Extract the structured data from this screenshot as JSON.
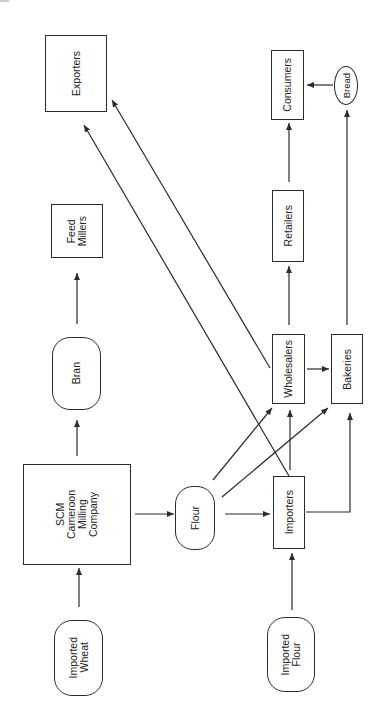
{
  "diagram": {
    "title": "",
    "orientation": "rotated-90-ccw",
    "nodes": [
      {
        "id": "imported_wheat",
        "label": "Imported\nWheat",
        "shape": "rounded"
      },
      {
        "id": "scm",
        "label": "SCM\nCameroon\nMilling\nCompany",
        "shape": "rect"
      },
      {
        "id": "bran",
        "label": "Bran",
        "shape": "rounded"
      },
      {
        "id": "feed_millers",
        "label": "Feed\nMillers",
        "shape": "rect"
      },
      {
        "id": "flour",
        "label": "Flour",
        "shape": "rounded"
      },
      {
        "id": "imported_flour",
        "label": "Imported\nFlour",
        "shape": "rounded"
      },
      {
        "id": "importers",
        "label": "Importers",
        "shape": "rect"
      },
      {
        "id": "wholesalers",
        "label": "Wholesalers",
        "shape": "rect"
      },
      {
        "id": "bakeries",
        "label": "Bakeries",
        "shape": "rect"
      },
      {
        "id": "retailers",
        "label": "Retailers",
        "shape": "rect"
      },
      {
        "id": "consumers",
        "label": "Consumers",
        "shape": "rect"
      },
      {
        "id": "bread",
        "label": "Bread",
        "shape": "ellipse"
      },
      {
        "id": "exporters",
        "label": "Exporters",
        "shape": "rect"
      }
    ],
    "edges": [
      {
        "from": "imported_wheat",
        "to": "scm"
      },
      {
        "from": "scm",
        "to": "bran"
      },
      {
        "from": "bran",
        "to": "feed_millers"
      },
      {
        "from": "scm",
        "to": "flour"
      },
      {
        "from": "flour",
        "to": "importers"
      },
      {
        "from": "flour",
        "to": "wholesalers"
      },
      {
        "from": "flour",
        "to": "bakeries"
      },
      {
        "from": "imported_flour",
        "to": "importers"
      },
      {
        "from": "importers",
        "to": "wholesalers"
      },
      {
        "from": "importers",
        "to": "bakeries"
      },
      {
        "from": "importers",
        "to": "exporters"
      },
      {
        "from": "wholesalers",
        "to": "exporters"
      },
      {
        "from": "wholesalers",
        "to": "bakeries"
      },
      {
        "from": "wholesalers",
        "to": "retailers"
      },
      {
        "from": "retailers",
        "to": "consumers"
      },
      {
        "from": "bakeries",
        "to": "bread"
      },
      {
        "from": "bread",
        "to": "consumers"
      }
    ]
  },
  "labels": {
    "imported_wheat": "Imported\nWheat",
    "scm": "SCM\nCameroon\nMilling\nCompany",
    "bran": "Bran",
    "feed_millers": "Feed\nMillers",
    "flour": "Flour",
    "imported_flour": "Imported\nFlour",
    "importers": "Importers",
    "wholesalers": "Wholesalers",
    "bakeries": "Bakeries",
    "retailers": "Retailers",
    "consumers": "Consumers",
    "bread": "Bread",
    "exporters": "Exporters"
  },
  "colors": {
    "line": "#2b2b2b",
    "background": "#ffffff"
  }
}
